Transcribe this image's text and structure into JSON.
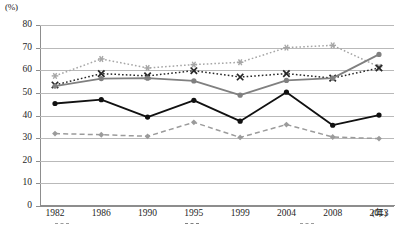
{
  "chart_data": {
    "type": "line",
    "title": "",
    "xlabel": "(年)",
    "ylabel": "(%)",
    "categories": [
      "1982",
      "1986",
      "1990",
      "1995",
      "1999",
      "2004",
      "2008",
      "2013"
    ],
    "ylim": [
      0,
      80
    ],
    "ytick_labels": [
      "0",
      "10",
      "20",
      "30",
      "40",
      "50",
      "60",
      "70",
      "80"
    ],
    "yticks": [
      0,
      10,
      20,
      30,
      40,
      50,
      60,
      70,
      80
    ],
    "grid": "horizontal",
    "legend_position": "bottom",
    "series": [
      {
        "name": "series-1-star-dotted-light",
        "values": [
          57.5,
          65.0,
          61.0,
          62.5,
          63.5,
          70.0,
          71.0,
          61.5
        ],
        "color": "#a6a6a6",
        "line_style": "dotted",
        "marker": "star"
      },
      {
        "name": "series-2-cross-dotted-dark",
        "values": [
          53.5,
          58.5,
          57.5,
          59.8,
          57.0,
          58.5,
          56.5,
          61.0
        ],
        "color": "#262626",
        "line_style": "dotted",
        "marker": "cross"
      },
      {
        "name": "series-3-circle-solid-gray",
        "values": [
          53.0,
          56.3,
          56.5,
          55.3,
          49.0,
          55.5,
          56.5,
          67.0
        ],
        "color": "#808080",
        "line_style": "solid",
        "marker": "circle"
      },
      {
        "name": "series-4-circle-solid-black",
        "values": [
          45.3,
          47.0,
          39.3,
          46.7,
          37.5,
          50.3,
          35.7,
          40.2
        ],
        "color": "#111111",
        "line_style": "solid",
        "marker": "circle"
      },
      {
        "name": "series-5-diamond-dashed-gray",
        "values": [
          32.0,
          31.5,
          30.8,
          37.0,
          30.3,
          36.0,
          30.5,
          29.8
        ],
        "color": "#9b9b9b",
        "line_style": "dashed",
        "marker": "diamond"
      }
    ]
  },
  "legend": {
    "items": [
      {
        "label": "",
        "color": "#9b9b9b"
      },
      {
        "label": "",
        "color": "#808080"
      },
      {
        "label": "",
        "color": "#9b9b9b"
      }
    ]
  }
}
